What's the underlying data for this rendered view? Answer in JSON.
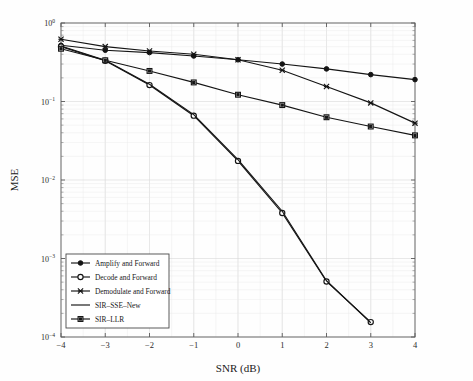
{
  "chart_data": {
    "type": "line",
    "title": "",
    "xlabel": "SNR (dB)",
    "ylabel": "MSE",
    "xlim": [
      -4,
      4
    ],
    "ylim": [
      0.0001,
      1
    ],
    "yscale": "log",
    "xscale": "linear",
    "grid": true,
    "legend_position": "lower-left",
    "x_tick_labels": [
      "-4",
      "-3",
      "-2",
      "-1",
      "0",
      "1",
      "2",
      "3",
      "4"
    ],
    "x": [
      -4,
      -3,
      -2,
      -1,
      0,
      1,
      2,
      3,
      4
    ],
    "y_tick_labels": [
      "10^0",
      "10^-1",
      "10^-2",
      "10^-3",
      "10^-4"
    ],
    "y_tick_mantissa": [
      "10",
      "10",
      "10",
      "10",
      "10"
    ],
    "y_tick_exponents": [
      "0",
      "-1",
      "-2",
      "-3",
      "-4"
    ],
    "y_tick_values": [
      1,
      0.1,
      0.01,
      0.001,
      0.0001
    ],
    "series": [
      {
        "name": "Amplify and Forward",
        "marker": "filled-circle",
        "x": [
          -4,
          -3,
          -2,
          -1,
          0,
          1,
          2,
          3,
          4
        ],
        "values": [
          0.52,
          0.45,
          0.42,
          0.38,
          0.34,
          0.3,
          0.26,
          0.22,
          0.19
        ]
      },
      {
        "name": "Decode and Forward",
        "marker": "open-circle",
        "x": [
          -4,
          -3,
          -2,
          -1,
          0,
          1,
          2,
          3
        ],
        "values": [
          0.5,
          0.33,
          0.162,
          0.066,
          0.0175,
          0.0038,
          0.00051,
          0.000155
        ]
      },
      {
        "name": "Demodulate and Forward",
        "marker": "cross",
        "x": [
          -4,
          -3,
          -2,
          -1,
          0,
          1,
          2,
          3,
          4
        ],
        "values": [
          0.62,
          0.5,
          0.44,
          0.4,
          0.34,
          0.25,
          0.155,
          0.096,
          0.053
        ]
      },
      {
        "name": "SIR-SSE-New",
        "marker": "none",
        "x": [
          -4,
          -3,
          -2,
          -1,
          0,
          1,
          2,
          3
        ],
        "values": [
          0.51,
          0.335,
          0.166,
          0.068,
          0.0182,
          0.004,
          0.00052,
          0.000152
        ]
      },
      {
        "name": "SIR-LLR",
        "marker": "filled-square",
        "x": [
          -4,
          -3,
          -2,
          -1,
          0,
          1,
          2,
          3,
          4
        ],
        "values": [
          0.47,
          0.335,
          0.245,
          0.175,
          0.122,
          0.09,
          0.063,
          0.048,
          0.037
        ]
      }
    ],
    "legend_entries": [
      {
        "label": "Amplify and Forward",
        "marker": "filled-circle"
      },
      {
        "label": "Decode and Forward",
        "marker": "open-circle"
      },
      {
        "label": "Demodulate and Forward",
        "marker": "cross"
      },
      {
        "label": "SIR–SSE–New",
        "marker": "none"
      },
      {
        "label": "SIR–LLR",
        "marker": "filled-square"
      }
    ],
    "colors": {
      "series": "#141414",
      "axis": "#6f6f6f",
      "grid": "#d9d9d9",
      "background": "#fefefe"
    }
  }
}
